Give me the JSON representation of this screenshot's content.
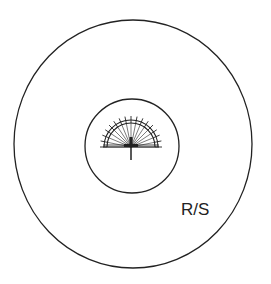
{
  "diagram": {
    "label": "R/S",
    "colors": {
      "stroke": "#222222",
      "background": "#ffffff"
    },
    "outer_circle": {
      "cx": 133,
      "cy": 144,
      "rx": 119,
      "ry": 124
    },
    "inner_circle": {
      "cx": 132,
      "cy": 146,
      "r": 47
    },
    "protractor": {
      "cx": 131,
      "cy": 147,
      "r_inner": 24,
      "r_outer": 27,
      "tick_len": 4,
      "ticks": 17,
      "stem_length": 13
    }
  }
}
